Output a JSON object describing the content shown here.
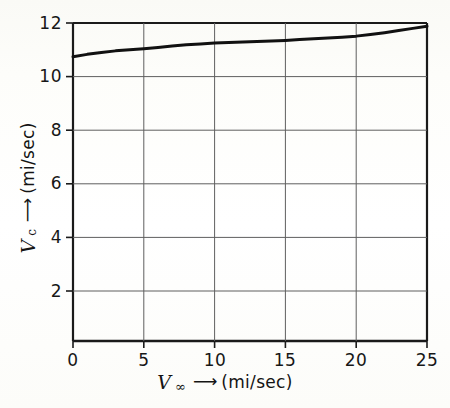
{
  "figure": {
    "background_color": "#fdfdfb",
    "ink_color": "#141414",
    "grid_color": "#6f6f6f"
  },
  "axes": {
    "x": {
      "title_symbol": "V",
      "title_subscript": "∞",
      "title_arrow": "⟶",
      "title_units": "(mi/sec)",
      "ticks": [
        "0",
        "5",
        "10",
        "15",
        "20",
        "25"
      ],
      "range": [
        0,
        25
      ]
    },
    "y": {
      "title_symbol": "V",
      "title_subscript": "c",
      "title_arrow": "⟶",
      "title_units": "(mi/sec)",
      "ticks": [
        "2",
        "4",
        "6",
        "8",
        "10",
        "12"
      ],
      "range": [
        0,
        12
      ]
    }
  },
  "chart_data": {
    "type": "line",
    "title": "",
    "xlabel": "V∞ ⟶ (mi/sec)",
    "ylabel": "Vc ⟶ (mi/sec)",
    "xlim": [
      0,
      25
    ],
    "ylim": [
      0,
      12
    ],
    "xticks": [
      0,
      5,
      10,
      15,
      20,
      25
    ],
    "yticks": [
      2,
      4,
      6,
      8,
      10,
      12
    ],
    "grid": true,
    "legend": null,
    "series": [
      {
        "name": "escape-velocity-curve",
        "color": "#111111",
        "linewidth": 3.0,
        "x": [
          0,
          1,
          2,
          3,
          4,
          5,
          6,
          7,
          8,
          9,
          10,
          11,
          12,
          13,
          14,
          15,
          16,
          17,
          18,
          19,
          20,
          21,
          22,
          23,
          24,
          25
        ],
        "y": [
          10.74,
          10.83,
          10.9,
          10.96,
          11.0,
          11.04,
          11.09,
          11.14,
          11.19,
          11.22,
          11.25,
          11.27,
          11.29,
          11.31,
          11.33,
          11.35,
          11.38,
          11.41,
          11.44,
          11.47,
          11.51,
          11.57,
          11.64,
          11.72,
          11.8,
          11.88
        ]
      }
    ]
  }
}
